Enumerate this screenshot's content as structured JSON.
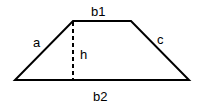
{
  "diagram": {
    "shape": "trapezoid",
    "stroke_color": "#000000",
    "background": "#ffffff",
    "labels": {
      "b1": "b1",
      "b2": "b2",
      "a": "a",
      "c": "c",
      "h": "h"
    }
  }
}
